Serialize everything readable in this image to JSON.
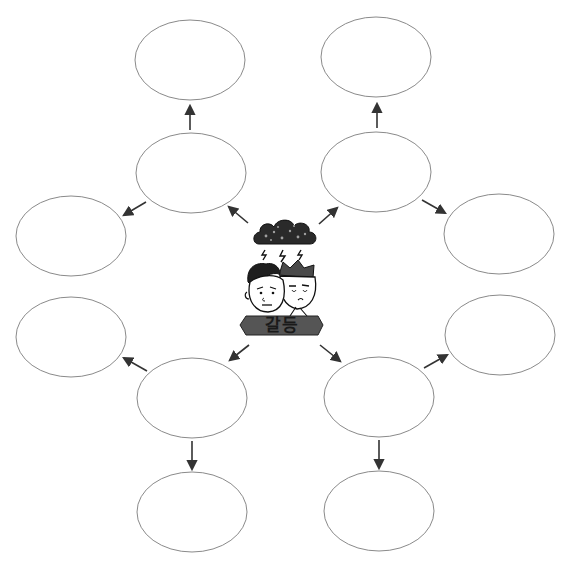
{
  "diagram": {
    "type": "mind-map",
    "center": {
      "label": "갈등",
      "illustration": "two-worried-men-under-storm-cloud",
      "banner_color": "#555555"
    },
    "colors": {
      "node_stroke": "#8a8a8a",
      "arrow": "#333333",
      "cloud": "#222222"
    },
    "nodes": [
      {
        "id": "upper-left-mid",
        "text": ""
      },
      {
        "id": "top-left",
        "text": ""
      },
      {
        "id": "left-upper",
        "text": ""
      },
      {
        "id": "upper-right-mid",
        "text": ""
      },
      {
        "id": "top-right",
        "text": ""
      },
      {
        "id": "right-upper",
        "text": ""
      },
      {
        "id": "lower-left-mid",
        "text": ""
      },
      {
        "id": "left-lower",
        "text": ""
      },
      {
        "id": "bottom-left",
        "text": ""
      },
      {
        "id": "lower-right-mid",
        "text": ""
      },
      {
        "id": "right-lower",
        "text": ""
      },
      {
        "id": "bottom-right",
        "text": ""
      }
    ]
  }
}
